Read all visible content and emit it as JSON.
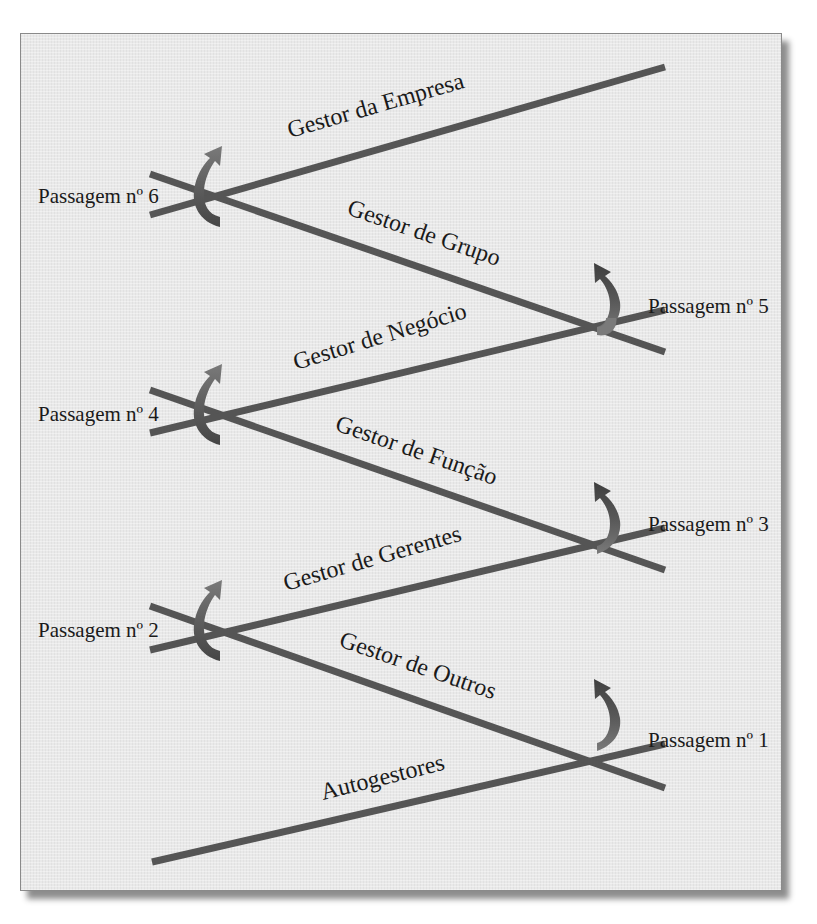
{
  "diagram": {
    "type": "leadership-pipeline",
    "colors": {
      "line": "#555555",
      "arrow_top": "#6f6f6f",
      "arrow_bottom": "#4a4a4a",
      "panel_bg": "#e9e9e9",
      "text": "#1a1a1a"
    },
    "levels": [
      {
        "id": "l1",
        "label": "Autogestores"
      },
      {
        "id": "l2",
        "label": "Gestor de Outros"
      },
      {
        "id": "l3",
        "label": "Gestor de Gerentes"
      },
      {
        "id": "l4",
        "label": "Gestor de Função"
      },
      {
        "id": "l5",
        "label": "Gestor de Negócio"
      },
      {
        "id": "l6",
        "label": "Gestor de Grupo"
      },
      {
        "id": "l7",
        "label": "Gestor da Empresa"
      }
    ],
    "passages": [
      {
        "id": "p1",
        "label": "Passagem nº 1",
        "side": "right"
      },
      {
        "id": "p2",
        "label": "Passagem nº 2",
        "side": "left"
      },
      {
        "id": "p3",
        "label": "Passagem nº 3",
        "side": "right"
      },
      {
        "id": "p4",
        "label": "Passagem nº 4",
        "side": "left"
      },
      {
        "id": "p5",
        "label": "Passagem nº 5",
        "side": "right"
      },
      {
        "id": "p6",
        "label": "Passagem nº 6",
        "side": "left"
      }
    ]
  }
}
